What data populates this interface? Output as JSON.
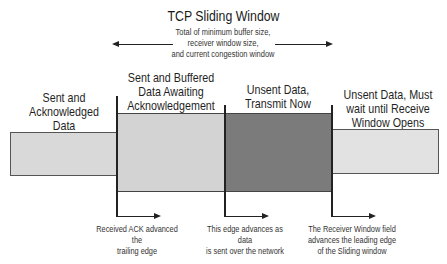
{
  "header": {
    "cut_text": "...sliding window...",
    "title": "TCP Sliding Window",
    "subtitle": [
      "Total of minimum buffer size,",
      "receiver window size,",
      "and current congestion window"
    ]
  },
  "regions": [
    {
      "id": "acked",
      "lines": [
        "Sent and",
        "Acknowledged",
        "Data"
      ],
      "color": "#d9d9d9"
    },
    {
      "id": "buffered",
      "lines": [
        "Sent and Buffered",
        "Data Awaiting",
        "Acknowledgement"
      ],
      "color": "#d3d3d3"
    },
    {
      "id": "transmit",
      "lines": [
        "Unsent Data,",
        "Transmit Now"
      ],
      "color": "#7b7b7b"
    },
    {
      "id": "wait",
      "lines": [
        "Unsent Data, Must",
        "wait until Receive",
        "Window Opens"
      ],
      "color": "#e2e2e2"
    }
  ],
  "edges": [
    {
      "id": "trailing",
      "lines": [
        "Received ACK advanced the",
        "trailing edge"
      ]
    },
    {
      "id": "send",
      "lines": [
        "This edge advances as data",
        "is sent over the network"
      ]
    },
    {
      "id": "leading",
      "lines": [
        "The Receiver Window field",
        "advances the leading edge",
        "of the Sliding window"
      ]
    }
  ]
}
